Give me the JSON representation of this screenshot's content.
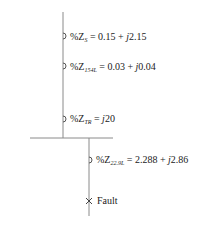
{
  "diagram": {
    "type": "single-line impedance diagram",
    "impedances": [
      {
        "id": "source",
        "prefix": "%Z",
        "subscript": "S",
        "value": "= 0.15 + ",
        "j": "j",
        "imag": "2.15"
      },
      {
        "id": "line154",
        "prefix": "%Z",
        "subscript": "154L",
        "value": "= 0.03 + ",
        "j": "j",
        "imag": "0.04"
      },
      {
        "id": "transformer",
        "prefix": "%Z",
        "subscript": "TR",
        "value": "= ",
        "j": "j",
        "imag": "20"
      },
      {
        "id": "line229",
        "prefix": "%Z",
        "subscript": "22.9L",
        "value": "= 2.288 + ",
        "j": "j",
        "imag": "2.86"
      }
    ],
    "fault_label": "Fault",
    "line_color": "#8a8a8a",
    "text_color": "#222222"
  }
}
